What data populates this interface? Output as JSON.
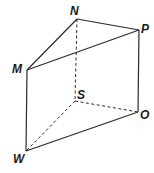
{
  "figure": {
    "type": "triangular-prism",
    "width": 154,
    "height": 173,
    "stroke_color": "#2a2a2a",
    "label_color": "#1a1a1a"
  },
  "vertices": {
    "N": {
      "label": "N",
      "x": 77,
      "y": 19
    },
    "P": {
      "label": "P",
      "x": 139,
      "y": 30
    },
    "M": {
      "label": "M",
      "x": 27,
      "y": 70
    },
    "S": {
      "label": "S",
      "x": 75,
      "y": 101
    },
    "O": {
      "label": "O",
      "x": 138,
      "y": 112
    },
    "W": {
      "label": "W",
      "x": 26,
      "y": 151
    }
  },
  "labels": {
    "N": "N",
    "P": "P",
    "M": "M",
    "S": "S",
    "O": "O",
    "W": "W"
  },
  "edges": {
    "solid": [
      [
        "N",
        "P"
      ],
      [
        "N",
        "M"
      ],
      [
        "M",
        "P"
      ],
      [
        "M",
        "W"
      ],
      [
        "P",
        "O"
      ],
      [
        "W",
        "O"
      ]
    ],
    "dashed": [
      [
        "N",
        "S"
      ],
      [
        "S",
        "O"
      ],
      [
        "S",
        "W"
      ]
    ]
  }
}
